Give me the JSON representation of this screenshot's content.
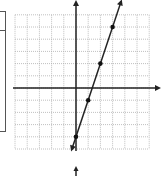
{
  "chart_data": {
    "type": "line",
    "title": "",
    "xlabel": "",
    "ylabel": "",
    "grid": true,
    "xlim": [
      -5,
      6
    ],
    "ylim": [
      -5,
      6
    ],
    "equation": "y = 3x - 4",
    "series": [
      {
        "name": "line",
        "points": [
          {
            "x": 0,
            "y": -4
          },
          {
            "x": 1,
            "y": -1
          },
          {
            "x": 2,
            "y": 2
          },
          {
            "x": 3,
            "y": 5
          }
        ]
      }
    ],
    "arrows": [
      "both-ends"
    ]
  },
  "colors": {
    "axis": "#222222",
    "grid": "#b0b0b0",
    "line": "#222222",
    "point": "#111111"
  }
}
